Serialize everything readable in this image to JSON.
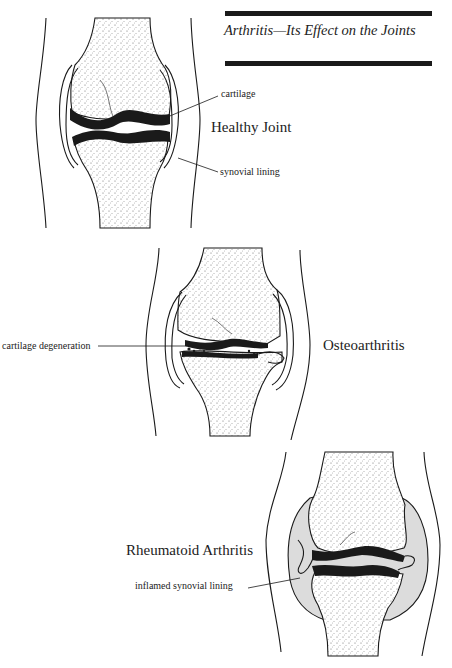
{
  "header": {
    "title": "Arthritis—Its Effect on the Joints"
  },
  "panels": [
    {
      "name": "Healthy Joint",
      "callouts": [
        "cartilage",
        "synovial lining"
      ]
    },
    {
      "name": "Osteoarthritis",
      "callouts": [
        "cartilage degeneration"
      ]
    },
    {
      "name": "Rheumatoid Arthritis",
      "callouts": [
        "inflamed synovial lining"
      ]
    }
  ],
  "colors": {
    "ink": "#1a1a1a",
    "inflamed_fill": "#dcdcdc",
    "background": "#ffffff"
  }
}
